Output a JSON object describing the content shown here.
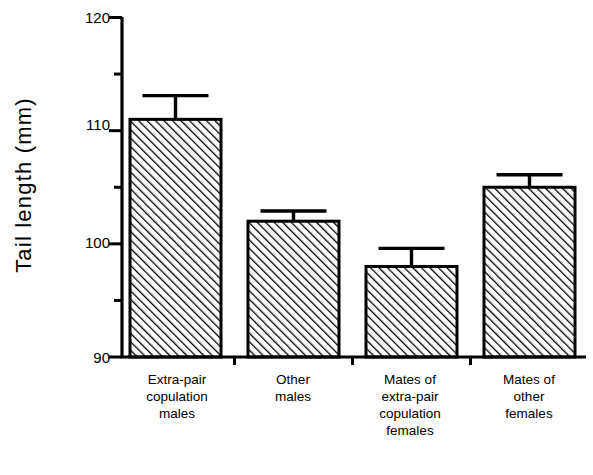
{
  "figure": {
    "background_color": "#ffffff",
    "ink_color": "#000000"
  },
  "axes": {
    "ylabel": "Tail length  (mm)",
    "xlabel": "",
    "y_major_ticks": [
      "120",
      "110",
      "100",
      "90"
    ],
    "y_minor_ticks": [
      "115",
      "105",
      "95"
    ]
  },
  "chart_data": {
    "type": "bar",
    "title": "",
    "xlabel": "",
    "ylabel": "Tail length (mm)",
    "ylim": [
      90,
      120
    ],
    "yticks": [
      90,
      95,
      100,
      105,
      110,
      115,
      120
    ],
    "ytick_labels_major": [
      90,
      100,
      110,
      120
    ],
    "grid": false,
    "legend": false,
    "bar_style": "diagonal-hatch",
    "error_bars": "upper-only",
    "categories": [
      "Extra-pair copulation males",
      "Other males",
      "Mates of extra-pair copulation females",
      "Mates of other females"
    ],
    "category_lines": [
      [
        "Extra-pair",
        "copulation",
        "males"
      ],
      [
        "Other",
        "males"
      ],
      [
        "Mates of",
        "extra-pair",
        "copulation",
        "females"
      ],
      [
        "Mates of",
        "other",
        "females"
      ]
    ],
    "values": [
      111.0,
      102.0,
      98.0,
      105.0
    ],
    "errors": [
      2.1,
      0.9,
      1.6,
      1.1
    ],
    "error_tops": [
      113.1,
      102.9,
      99.6,
      106.1
    ]
  }
}
